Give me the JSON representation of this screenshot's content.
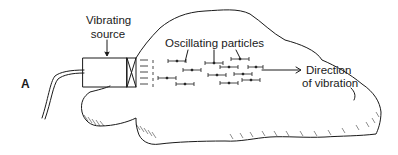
{
  "diagram": {
    "panel_label": "A",
    "labels": {
      "source_line1": "Vibrating",
      "source_line2": "source",
      "particles": "Oscillating particles",
      "direction_line1": "Direction",
      "direction_line2": "of vibration"
    },
    "colors": {
      "ink": "#1a1a1a",
      "background": "#ffffff"
    }
  }
}
